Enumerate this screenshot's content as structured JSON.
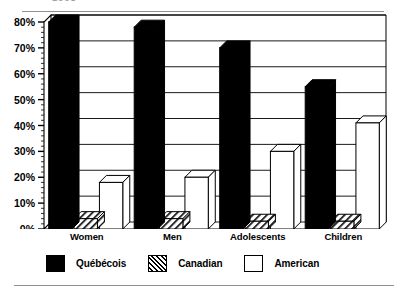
{
  "figure": {
    "top_caption_partial": "1993",
    "bottom_rule": true
  },
  "chart_data": {
    "type": "bar",
    "title": "",
    "subtitle": "",
    "xlabel": "",
    "ylabel": "",
    "categories": [
      "Women",
      "Men",
      "Adolescents",
      "Children"
    ],
    "series": [
      {
        "name": "Québécois",
        "style": "solid-black",
        "values": [
          80,
          78,
          70,
          55
        ]
      },
      {
        "name": "Canadian",
        "style": "hatched",
        "values": [
          4,
          4,
          3,
          3
        ]
      },
      {
        "name": "American",
        "style": "open-white",
        "values": [
          18,
          20,
          30,
          41
        ]
      }
    ],
    "ylim": [
      0,
      80
    ],
    "yticks": [
      0,
      10,
      20,
      30,
      40,
      50,
      60,
      70,
      80
    ],
    "ytick_labels": [
      "0%",
      "10%",
      "20%",
      "30%",
      "40%",
      "50%",
      "60%",
      "70%",
      "80%"
    ],
    "grid": "horizontal",
    "legend_position": "bottom",
    "bar_render": "3d-extruded",
    "minor_ticks": true
  },
  "legend": {
    "items": [
      {
        "label": "Québécois",
        "swatch": "solid"
      },
      {
        "label": "Canadian",
        "swatch": "hatch"
      },
      {
        "label": "American",
        "swatch": "open"
      }
    ]
  },
  "axis": {
    "y_tick_labels": [
      "80%",
      "70%",
      "60%",
      "50%",
      "40%",
      "30%",
      "20%",
      "10%",
      "0%"
    ],
    "x_categories": [
      "Women",
      "Men",
      "Adolescents",
      "Children"
    ]
  },
  "colors": {
    "ink": "#000000",
    "paper": "#ffffff",
    "rule": "#8f8f8f",
    "ghost_text": "#9a9a9a"
  }
}
